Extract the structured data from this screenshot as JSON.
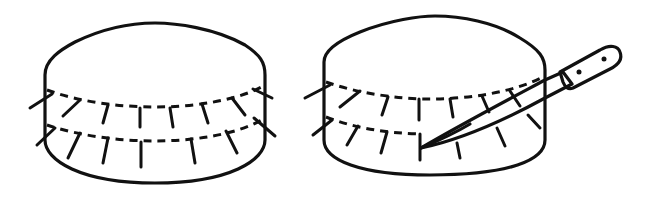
{
  "figure": {
    "panels": [
      {
        "id": "left",
        "label": "Cake with two rings of toothpicks marking cut lines"
      },
      {
        "id": "right",
        "label": "Knife cutting along the toothpick guide line"
      }
    ],
    "colors": {
      "ink": "#111111",
      "background": "#ffffff"
    },
    "icons": [
      "cake-icon",
      "toothpick-icon",
      "knife-icon"
    ]
  }
}
